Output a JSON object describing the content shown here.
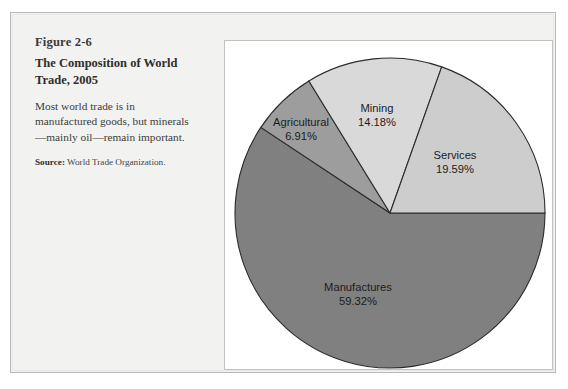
{
  "figure": {
    "number": "Figure 2-6",
    "title": "The Composition of World Trade, 2005",
    "body": "Most world trade is in manufactured goods, but minerals—mainly oil—remain important.",
    "source_label": "Source:",
    "source_text": "World Trade Organization."
  },
  "chart_data": {
    "type": "pie",
    "title": "The Composition of World Trade, 2005",
    "categories": [
      "Manufactures",
      "Agricultural",
      "Mining",
      "Services"
    ],
    "values": [
      59.32,
      6.91,
      14.18,
      19.59
    ],
    "unit": "%",
    "total": 100.0,
    "legend": "none",
    "labels_inside": true,
    "start_angle_deg": 0,
    "direction": "clockwise",
    "slices": [
      {
        "name": "Manufactures",
        "value": 59.32,
        "value_label": "59.32%",
        "color": "#808080",
        "start_deg": 0,
        "end_deg": 213.55
      },
      {
        "name": "Agricultural",
        "value": 6.91,
        "value_label": "6.91%",
        "color": "#9d9d9d",
        "start_deg": 213.55,
        "end_deg": 238.43
      },
      {
        "name": "Mining",
        "value": 14.18,
        "value_label": "14.18%",
        "color": "#d9d9d9",
        "start_deg": 238.43,
        "end_deg": 289.48
      },
      {
        "name": "Services",
        "value": 19.59,
        "value_label": "19.59%",
        "color": "#cdcdcd",
        "start_deg": 289.48,
        "end_deg": 360
      }
    ],
    "label_manufactures_name": "Manufactures",
    "label_manufactures_value": "59.32%",
    "label_agricultural_name": "Agricultural",
    "label_agricultural_value": "6.91%",
    "label_mining_name": "Mining",
    "label_mining_value": "14.18%",
    "label_services_name": "Services",
    "label_services_value": "19.59%"
  }
}
